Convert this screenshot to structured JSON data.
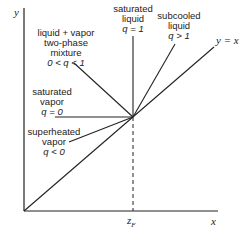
{
  "diagram": {
    "axes": {
      "x_label": "x",
      "y_label": "y",
      "feed_label": "z",
      "feed_sub": "F"
    },
    "diagonal_label": "y = x",
    "regions": [
      {
        "id": "two-phase",
        "line1": "liquid + vapor",
        "line2": "two-phase",
        "line3": "mixture",
        "line4": "0 < q < 1"
      },
      {
        "id": "saturated-liquid",
        "line1": "saturated",
        "line2": "liquid",
        "line3": "q = 1"
      },
      {
        "id": "subcooled-liquid",
        "line1": "subcooled",
        "line2": "liquid",
        "line3": "q > 1"
      },
      {
        "id": "saturated-vapor",
        "line1": "saturated",
        "line2": "vapor",
        "line3": "q = 0"
      },
      {
        "id": "superheated-vapor",
        "line1": "superheated",
        "line2": "vapor",
        "line3": "q < 0"
      }
    ],
    "colors": {
      "line": "#222222",
      "background": "#ffffff"
    }
  }
}
